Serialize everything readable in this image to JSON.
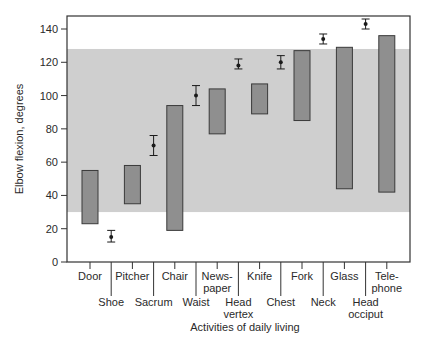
{
  "chart_data": {
    "type": "range-bar-with-errorbars",
    "title": "",
    "xlabel": "Activities of daily living",
    "ylabel": "Elbow flexion, degrees",
    "ylim": [
      0,
      145
    ],
    "yticks": [
      0,
      20,
      40,
      60,
      80,
      100,
      120,
      140
    ],
    "grid": false,
    "legend": null,
    "functional_range_band": {
      "low": 30,
      "high": 128
    },
    "categories": [
      "Door",
      "Shoe",
      "Pitcher",
      "Sacrum",
      "Chair",
      "Waist",
      "News-paper",
      "Head vertex",
      "Knife",
      "Chest",
      "Fork",
      "Neck",
      "Glass",
      "Head occiput",
      "Tele-phone"
    ],
    "range_bars": [
      {
        "label": "Door",
        "low": 23,
        "high": 55
      },
      {
        "label": "Pitcher",
        "low": 35,
        "high": 58
      },
      {
        "label": "Chair",
        "low": 19,
        "high": 94
      },
      {
        "label": "Newspaper",
        "low": 77,
        "high": 104
      },
      {
        "label": "Knife",
        "low": 89,
        "high": 107
      },
      {
        "label": "Fork",
        "low": 85,
        "high": 127
      },
      {
        "label": "Glass",
        "low": 44,
        "high": 129
      },
      {
        "label": "Telephone",
        "low": 42,
        "high": 136
      }
    ],
    "points": [
      {
        "label": "Shoe",
        "mean": 15,
        "low": 12,
        "high": 19
      },
      {
        "label": "Sacrum",
        "mean": 70,
        "low": 64,
        "high": 76
      },
      {
        "label": "Waist",
        "mean": 100,
        "low": 94,
        "high": 106
      },
      {
        "label": "Head vertex",
        "mean": 118,
        "low": 116,
        "high": 122
      },
      {
        "label": "Chest",
        "mean": 120,
        "low": 116,
        "high": 124
      },
      {
        "label": "Neck",
        "mean": 134,
        "low": 131,
        "high": 137
      },
      {
        "label": "Head occiput",
        "mean": 143,
        "low": 140,
        "high": 146
      }
    ]
  },
  "labels": {
    "top_row": [
      {
        "lines": [
          "Door"
        ]
      },
      {
        "lines": [
          "Pitcher"
        ]
      },
      {
        "lines": [
          "Chair"
        ]
      },
      {
        "lines": [
          "News-",
          "paper"
        ]
      },
      {
        "lines": [
          "Knife"
        ]
      },
      {
        "lines": [
          "Fork"
        ]
      },
      {
        "lines": [
          "Glass"
        ]
      },
      {
        "lines": [
          "Tele-",
          "phone"
        ]
      }
    ],
    "bottom_row": [
      {
        "lines": [
          "Shoe"
        ]
      },
      {
        "lines": [
          "Sacrum"
        ]
      },
      {
        "lines": [
          "Waist"
        ]
      },
      {
        "lines": [
          "Head",
          "vertex"
        ]
      },
      {
        "lines": [
          "Chest"
        ]
      },
      {
        "lines": [
          "Neck"
        ]
      },
      {
        "lines": [
          "Head",
          "occiput"
        ]
      }
    ]
  },
  "colors": {
    "band": "#cfcfcf",
    "bar_fill": "#8f8f8f",
    "bar_stroke": "#3a3a3a",
    "axis": "#333333",
    "point": "#1a1a1a"
  }
}
